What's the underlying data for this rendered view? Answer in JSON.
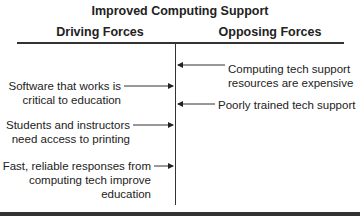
{
  "title": "Improved Computing Support",
  "columns": {
    "driving": "Driving Forces",
    "opposing": "Opposing Forces"
  },
  "driving_forces": [
    {
      "line1": "Software that works is",
      "line2": "critical to education"
    },
    {
      "line1": "Students and instructors",
      "line2": "need access to printing"
    },
    {
      "line1": "Fast, reliable responses from",
      "line2": "computing tech improve",
      "line3": "education"
    }
  ],
  "opposing_forces": [
    {
      "line1": "Computing tech support",
      "line2": "resources are expensive"
    },
    {
      "line1": "Poorly trained tech support"
    }
  ]
}
